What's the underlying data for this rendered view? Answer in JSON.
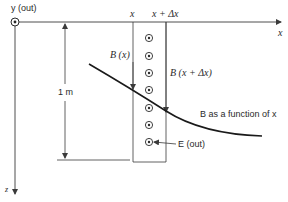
{
  "diagram": {
    "axes": {
      "y_label": "y (out)",
      "x_label": "x",
      "z_label": "z"
    },
    "top_labels": {
      "x": "x",
      "x_plus_dx": "x + Δx"
    },
    "dimension": {
      "label": "1 m"
    },
    "field_labels": {
      "b_at_x": "B (x)",
      "b_at_x_dx": "B (x + Δx)",
      "b_function": "B as a function of x",
      "e_out": "E (out)"
    },
    "colors": {
      "line": "#3a3a3a",
      "curve": "#1a1a1a",
      "background": "#ffffff"
    },
    "e_field_dots": 7
  }
}
